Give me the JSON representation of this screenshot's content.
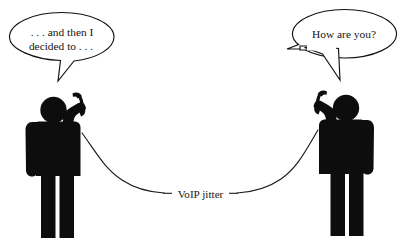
{
  "canvas": {
    "width": 405,
    "height": 243,
    "background_color": "#ffffff",
    "ink_color": "#0d0d0d",
    "title": "VoIP jitter"
  },
  "left_speaker": {
    "name": "caller-left",
    "bubble": {
      "line1": ". . . and then I",
      "line2": "decided to . . .",
      "tail_direction": "down-right"
    },
    "pose": "standing, holding telephone handset to ear with raised right arm"
  },
  "right_speaker": {
    "name": "caller-right",
    "bubble": {
      "line1": "How are you?",
      "line2": "",
      "tail_direction": "down-left"
    },
    "pose": "standing, holding telephone handset to ear with raised left arm"
  },
  "connection": {
    "label": "VoIP jitter",
    "line_style": "thin curved cord with horizontal leader lines",
    "stroke_color": "#1a1a1a"
  }
}
